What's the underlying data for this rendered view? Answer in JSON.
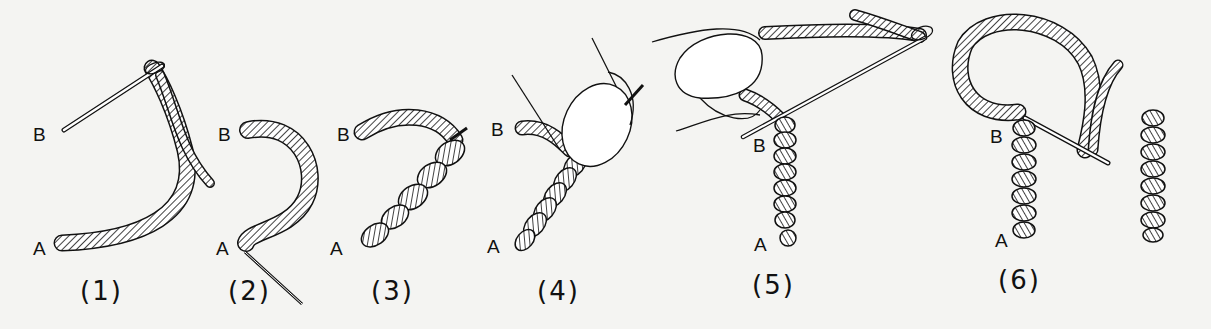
{
  "figure": {
    "steps": [
      {
        "caption": "(1)",
        "point_b": "B",
        "point_a": "A"
      },
      {
        "caption": "(2)",
        "point_b": "B",
        "point_a": "A"
      },
      {
        "caption": "(3)",
        "point_b": "B",
        "point_a": "A"
      },
      {
        "caption": "(4)",
        "point_b": "B",
        "point_a": "A"
      },
      {
        "caption": "(5)",
        "point_b": "B",
        "point_a": "A"
      },
      {
        "caption": "(6)",
        "point_b": "B",
        "point_a": "A"
      }
    ]
  },
  "colors": {
    "background": "#f4f4f2",
    "ink": "#111111"
  }
}
